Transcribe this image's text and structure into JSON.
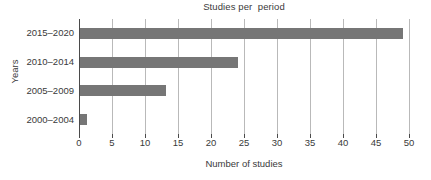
{
  "chart_data": {
    "type": "bar",
    "orientation": "horizontal",
    "title": "Studies per  period",
    "xlabel": "Number of studies",
    "ylabel": "Years",
    "categories": [
      "2000–2004",
      "2005–2009",
      "2010–2014",
      "2015–2020"
    ],
    "values": [
      1,
      13,
      24,
      49
    ],
    "series": [
      {
        "name": "Number of studies",
        "values": [
          1,
          13,
          24,
          49
        ]
      }
    ],
    "xlim": [
      0,
      50
    ],
    "xticks": [
      0,
      5,
      10,
      15,
      20,
      25,
      30,
      35,
      40,
      45,
      50
    ],
    "xtick_labels": [
      "0",
      "5",
      "10",
      "15",
      "20",
      "25",
      "30",
      "35",
      "40",
      "45",
      "50"
    ],
    "grid": "vertical",
    "legend": "none",
    "bar_color": "#767676",
    "gridline_color": "#b9b9b9",
    "axis_color": "#4a4a4a",
    "background_color": "#ffffff"
  }
}
